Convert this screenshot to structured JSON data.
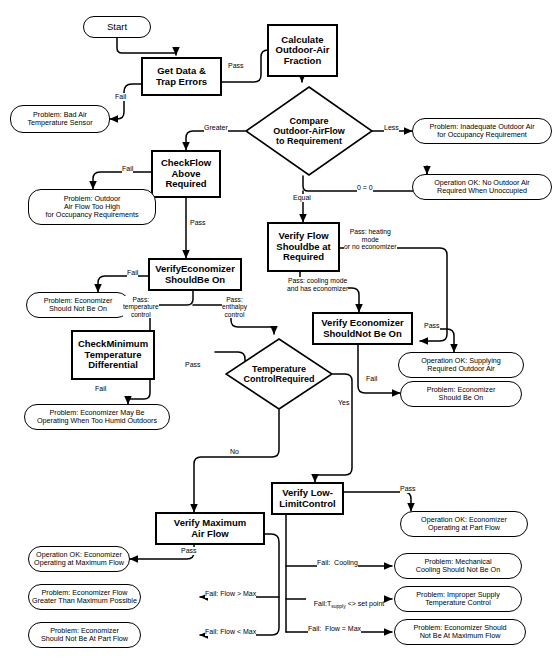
{
  "diagram": {
    "stroke_color": "#000000",
    "background_color": "#ffffff"
  },
  "nodes": {
    "start": "Start",
    "get_data": "Get Data &\nTrap Errors",
    "problem_bad_sensor": "Problem:  Bad Air\nTemperature Sensor",
    "calculate_oa_fraction": "Calculate\nOutdoor-Air\nFraction",
    "compare_flow": "Compare\nOutdoor-AirFlow\nto Requirement",
    "problem_inadequate_oa": "Problem:  Inadequate Outdoor Air\nfor Occupancy Requirement",
    "check_flow_above": "CheckFlow\nAbove\nRequired",
    "problem_oa_too_high": "Problem:  Outdoor\nAir Flow Too High\nfor Occupancy Requirements",
    "op_ok_no_oa_required": "Operation OK:  No Outdoor Air\nRequired When Unoccupied",
    "verify_econ_should_be_on": "VerifyEconomizer\nShouldBe On",
    "problem_econ_should_not_be_on": "Problem:  Economizer\nShould Not Be On",
    "verify_flow_at_required": "Verify Flow\nShouldbe at\nRequired",
    "check_min_temp_diff": "CheckMinimum\nTemperature\nDifferential",
    "problem_econ_humid": "Problem:  Economizer May Be\nOperating When Too Humid Outdoors",
    "verify_econ_should_not_be_on": "Verify Economizer\nShouldNot Be On",
    "op_ok_supplying_required_oa": "Operation OK: Supplying\nRequired Outdoor Air",
    "problem_econ_should_be_on": "Problem:  Economizer\nShould Be On",
    "temp_control_required": "Temperature\nControlRequired",
    "verify_low_limit": "Verify Low-\nLimitControl",
    "op_ok_part_flow": "Operation OK:  Economizer\nOperating at Part Flow",
    "problem_mech_cooling": "Problem:  Mechanical\nCooling Should Not Be On",
    "problem_improper_supply": "Problem:  Improper Supply\nTemperature Control",
    "problem_not_max_flow": "Problem:  Economizer Should\nNot Be At Maximum Flow",
    "verify_max_air_flow": "Verify Maximum\nAir Flow",
    "op_ok_max_flow": "Operation OK:  Economizer\nOperating at Maximum Flow",
    "problem_flow_greater": "Problem:  Economizer Flow\nGreater Than Maximum Possible",
    "problem_not_part_flow": "Problem:  Economizer\nShould Not Be At Part Flow"
  },
  "edge_labels": {
    "pass_1": "Pass",
    "fail_1": "Fail",
    "greater": "Greater",
    "less": "Less",
    "equal": "Equal",
    "zero_equals_zero": "0 = 0",
    "fail_2": "Fail",
    "pass_2": "Pass",
    "fail_3": "Fail",
    "pass_temperature_control": "Pass:\ntemperature\ncontrol",
    "pass_enthalpy_control": "Pass:\nenthalpy\ncontrol",
    "pass_heating_mode": "Pass:  heating\nmode\nor no economizer",
    "pass_cooling_mode": "Pass: cooling mode\nand has economizer",
    "pass_3": "Pass",
    "fail_4": "Fail",
    "fail_5": "Fail",
    "pass_4": "Pass",
    "yes": "Yes",
    "no": "No",
    "pass_5": "Pass",
    "fail_cooling": "Fail:  Cooling",
    "fail_tsupply_pre": "Fail:T",
    "fail_tsupply_sub": "supply",
    "fail_tsupply_post": " <> set point",
    "fail_flow_eq_max": "Fail:  Flow = Max",
    "pass_6": "Pass",
    "fail_flow_gt_max": "Fail: Flow > Max",
    "fail_flow_lt_max": "Fail: Flow < Max"
  }
}
